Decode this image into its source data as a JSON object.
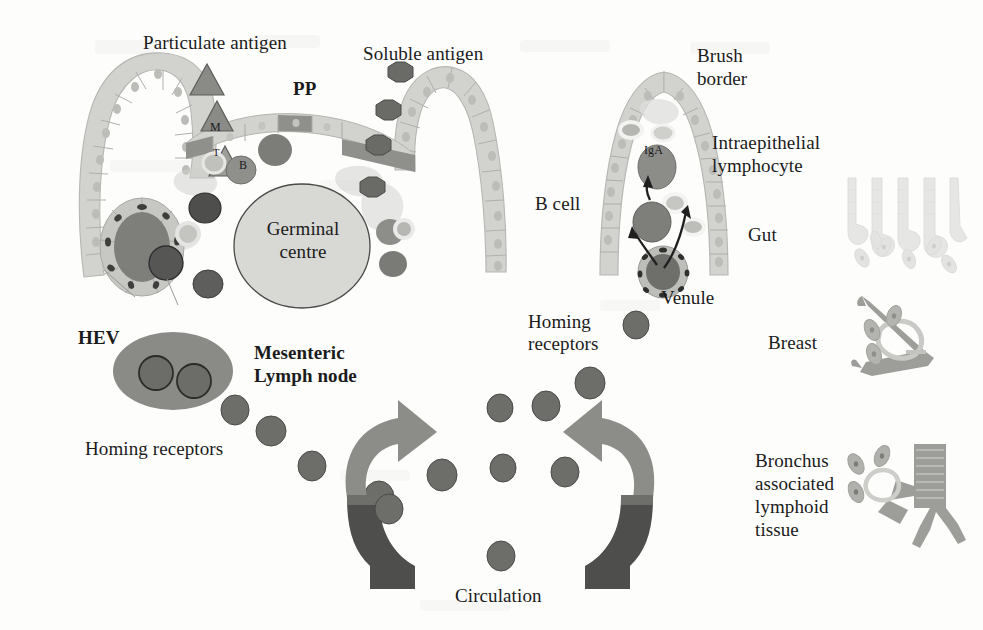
{
  "figure": {
    "background_color": "#fdfdfc"
  },
  "palette": {
    "epithelium_fill": "#d2d2cf",
    "epithelium_stroke": "#b4b4b0",
    "m_cell_fill": "#9a9a97",
    "dark_cell": "#5a5a58",
    "mid_cell": "#8e8e8b",
    "light_cell": "#c9c9c6",
    "germinal_centre_fill": "#d8d8d5",
    "germinal_centre_stroke": "#4a4a48",
    "lymph_node_fill": "#8a8a87",
    "arrow_light": "#8c8c89",
    "arrow_dark": "#4e4e4c",
    "homing_cell": "#6d6d6a",
    "text_color": "#1b1b1b",
    "faint_tissue": "#dedede"
  },
  "labels": {
    "particulate_antigen": "Particulate antigen",
    "soluble_antigen": "Soluble antigen",
    "pp": "PP",
    "m_cell": "M",
    "t_cell": "T",
    "b_cell_marker": "B",
    "germinal_centre_line1": "Germinal",
    "germinal_centre_line2": "centre",
    "hev": "HEV",
    "mesenteric_line1": "Mesenteric",
    "mesenteric_line2": "Lymph node",
    "homing_receptors_left": "Homing receptors",
    "homing_receptors_right_line1": "Homing",
    "homing_receptors_right_line2": "receptors",
    "circulation": "Circulation",
    "brush_border_line1": "Brush",
    "brush_border_line2": "border",
    "intraepithelial_line1": "Intraepithelial",
    "intraepithelial_line2": "lymphocyte",
    "b_cell": "B cell",
    "iga": "IgA",
    "venule": "Venule",
    "gut": "Gut",
    "breast": "Breast",
    "bronchus_line1": "Bronchus",
    "bronchus_line2": "associated",
    "bronchus_line3": "lymphoid",
    "bronchus_line4": "tissue"
  },
  "regions": {
    "peyers_patch": {
      "name": "Peyer's patch with follicle associated epithelium",
      "m_cell_present": true,
      "germinal_centre_present": true
    },
    "villus": {
      "name": "Intestinal villus with B cell, IgA plasma cell and venule"
    },
    "tissue_icons": [
      {
        "key": "gut",
        "label": "Gut"
      },
      {
        "key": "breast",
        "label": "Breast"
      },
      {
        "key": "bronchus",
        "label": "Bronchus associated lymphoid tissue"
      }
    ]
  },
  "cells": {
    "particulate_antigen_shape": "triangle",
    "soluble_antigen_shape": "octagon",
    "lymphocyte_shape": "circle"
  }
}
